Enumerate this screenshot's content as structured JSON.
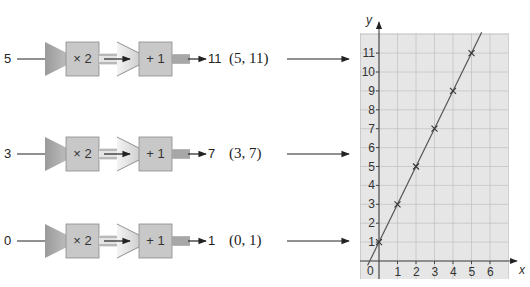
{
  "rows": [
    {
      "input": "5",
      "op1": "× 2",
      "op2": "+ 1",
      "output": "11",
      "pair": "(5, 11)",
      "y": 59
    },
    {
      "input": "3",
      "op1": "× 2",
      "op2": "+ 1",
      "output": "7",
      "pair": "(3, 7)",
      "y": 154
    },
    {
      "input": "0",
      "op1": "× 2",
      "op2": "+ 1",
      "output": "1",
      "pair": "(0, 1)",
      "y": 241
    }
  ],
  "graph": {
    "x_label": "x",
    "y_label": "y",
    "origin_label": "0",
    "x_ticks": [
      "1",
      "2",
      "3",
      "4",
      "5",
      "6"
    ],
    "y_ticks": [
      "1",
      "2",
      "3",
      "4",
      "5",
      "6",
      "7",
      "8",
      "9",
      "10",
      "11"
    ]
  },
  "colors": {
    "machine_box": "#c8c8c8",
    "funnel_dark": "#a8a8a8",
    "funnel_light": "#dcdcdc",
    "grid_bg": "#e6e6e6",
    "grid_line": "#c4c4c4",
    "line": "#555555"
  },
  "chart_data": {
    "type": "line",
    "title": "",
    "xlabel": "x",
    "ylabel": "y",
    "xlim": [
      -1,
      7
    ],
    "ylim": [
      -1,
      12
    ],
    "grid": true,
    "series": [
      {
        "name": "y = 2x + 1",
        "x": [
          0,
          1,
          2,
          3,
          4,
          5
        ],
        "y": [
          1,
          3,
          5,
          7,
          9,
          11
        ],
        "marker": "x"
      }
    ]
  }
}
